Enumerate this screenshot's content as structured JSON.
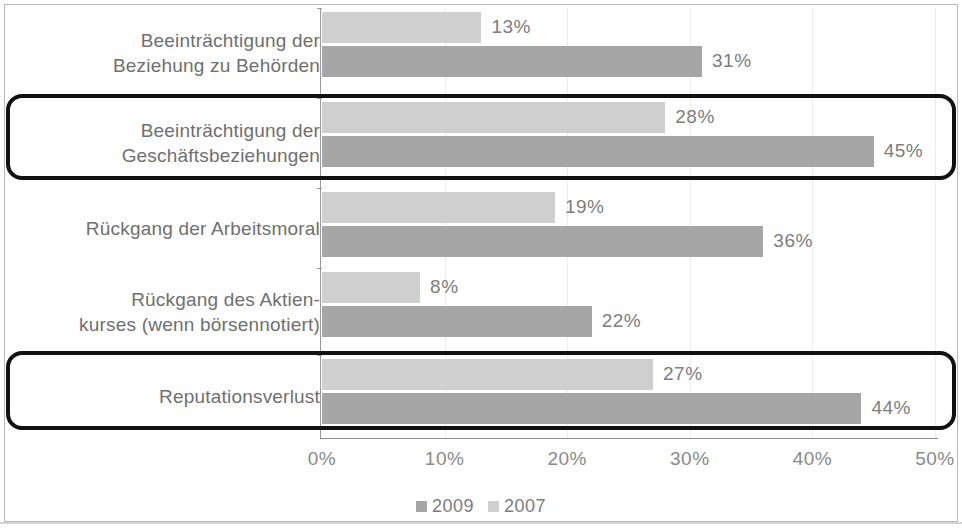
{
  "chart_data": {
    "type": "bar",
    "orientation": "horizontal",
    "title": "",
    "subtitle": "",
    "xlabel": "",
    "ylabel": "",
    "xlim": [
      0,
      50
    ],
    "xticks": [
      0,
      10,
      20,
      30,
      40,
      50
    ],
    "xtick_labels": [
      "0%",
      "10%",
      "20%",
      "30%",
      "40%",
      "50%"
    ],
    "grid": true,
    "legend_position": "bottom-center",
    "categories": [
      "Beeinträchtigung der\nBeziehung zu Behörden",
      "Beeinträchtigung der\nGeschäftsbeziehungen",
      "Rückgang der Arbeitsmoral",
      "Rückgang des Aktien-\nkurses (wenn börsennotiert)",
      "Reputationsverlust"
    ],
    "series": [
      {
        "name": "2007",
        "color": "#cfcfcf",
        "values": [
          13,
          28,
          19,
          8,
          27
        ],
        "value_labels": [
          "13%",
          "28%",
          "19%",
          "8%",
          "27%"
        ]
      },
      {
        "name": "2009",
        "color": "#a6a6a6",
        "values": [
          31,
          45,
          36,
          22,
          44
        ],
        "value_labels": [
          "31%",
          "45%",
          "36%",
          "22%",
          "44%"
        ]
      }
    ],
    "legend": [
      {
        "label": "2009",
        "color": "#a6a6a6"
      },
      {
        "label": "2007",
        "color": "#cfcfcf"
      }
    ],
    "highlighted_categories": [
      1,
      4
    ],
    "annotations": []
  }
}
